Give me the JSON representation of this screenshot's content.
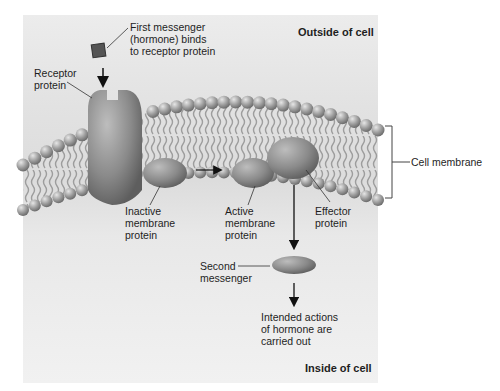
{
  "diagram": {
    "title_outside": "Outside of cell",
    "title_inside": "Inside of cell",
    "labels": {
      "first_messenger": [
        "First messenger",
        "(hormone) binds",
        "to receptor protein"
      ],
      "receptor_protein": [
        "Receptor",
        "protein"
      ],
      "inactive_protein": [
        "Inactive",
        "membrane",
        "protein"
      ],
      "active_protein": [
        "Active",
        "membrane",
        "protein"
      ],
      "effector_protein": [
        "Effector",
        "protein"
      ],
      "second_messenger": [
        "Second",
        "messenger"
      ],
      "intended_actions": [
        "Intended actions",
        "of hormone are",
        "carried out"
      ],
      "cell_membrane": "Cell membrane"
    },
    "colors": {
      "protein": "#8a8a8a",
      "hormone": "#555555",
      "phospholipid_head": "#9a9a9a",
      "background": "#e4e4e4",
      "arrow": "#111111"
    }
  }
}
